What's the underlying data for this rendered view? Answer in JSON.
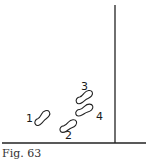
{
  "figure": {
    "caption": "Fig. 63",
    "line_color": "#222222",
    "wall": {
      "x": 115,
      "y_top": 5,
      "y_bottom": 143
    },
    "floor": {
      "y": 143,
      "x_left": 2,
      "x_right": 146
    },
    "footprints": [
      {
        "label": "1",
        "cx": 42,
        "cy": 118,
        "angle": -35,
        "label_x": 26,
        "label_y": 122
      },
      {
        "label": "2",
        "cx": 68,
        "cy": 126,
        "angle": -22,
        "label_x": 65,
        "label_y": 139
      },
      {
        "label": "3",
        "cx": 84,
        "cy": 97,
        "angle": -25,
        "label_x": 81,
        "label_y": 90
      },
      {
        "label": "4",
        "cx": 84,
        "cy": 110,
        "angle": -18,
        "label_x": 96,
        "label_y": 120
      }
    ]
  }
}
